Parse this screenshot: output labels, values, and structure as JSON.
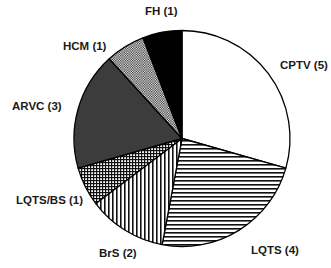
{
  "chart_data": {
    "type": "pie",
    "title": "",
    "start_angle_deg": 0,
    "direction": "clockwise",
    "total": 17,
    "categories": [
      "CPTV",
      "LQTS",
      "BrS",
      "LQTS/BS",
      "ARVC",
      "HCM",
      "FH"
    ],
    "values": [
      5,
      4,
      2,
      1,
      3,
      1,
      1
    ],
    "labels": [
      "CPTV (5)",
      "LQTS (4)",
      "BrS (2)",
      "LQTS/BS (1)",
      "ARVC (3)",
      "HCM (1)",
      "FH (1)"
    ],
    "fills": [
      "white",
      "horizontal-lines",
      "vertical-lines",
      "crosshatch-grid",
      "dark-gray",
      "fine-checker",
      "black"
    ],
    "colors": {
      "outline": "#000000",
      "dark_gray": "#3c3c3c",
      "black": "#000000",
      "white": "#ffffff"
    },
    "legend": "none (labels placed around slices)"
  },
  "labels": {
    "cptv": "CPTV (5)",
    "lqts": "LQTS (4)",
    "brs": "BrS (2)",
    "lqts_bs": "LQTS/BS (1)",
    "arvc": "ARVC (3)",
    "hcm": "HCM (1)",
    "fh": "FH (1)"
  }
}
